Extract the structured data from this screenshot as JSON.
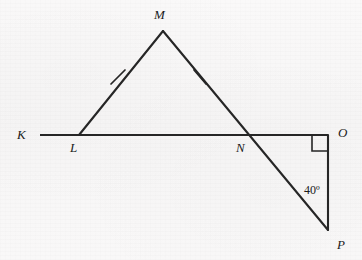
{
  "figure": {
    "kind": "geometry-diagram",
    "stroke_color": "#262626",
    "background_color": "#f8f7f7",
    "canvas": {
      "width": 362,
      "height": 260
    }
  },
  "points": {
    "K": {
      "label": "K",
      "x": 40,
      "y": 135,
      "label_x": 17,
      "label_y": 128
    },
    "L": {
      "label": "L",
      "x": 79,
      "y": 135,
      "label_x": 70,
      "label_y": 141
    },
    "M": {
      "label": "M",
      "x": 163,
      "y": 31,
      "label_x": 154,
      "label_y": 8
    },
    "N": {
      "label": "N",
      "x": 248,
      "y": 135,
      "label_x": 236,
      "label_y": 141
    },
    "O": {
      "label": "O",
      "x": 328,
      "y": 135,
      "label_x": 338,
      "label_y": 126
    },
    "P": {
      "label": "P",
      "x": 328,
      "y": 230,
      "label_x": 337,
      "label_y": 238
    }
  },
  "segments": [
    {
      "name": "segment-KO",
      "from": "K",
      "to": "O",
      "x1": 40,
      "y1": 135,
      "x2": 328,
      "y2": 135
    },
    {
      "name": "segment-LM",
      "from": "L",
      "to": "M",
      "x1": 79,
      "y1": 135,
      "x2": 163,
      "y2": 31
    },
    {
      "name": "segment-MP",
      "from": "M",
      "to": "P",
      "x1": 163,
      "y1": 31,
      "x2": 328,
      "y2": 230
    },
    {
      "name": "segment-OP",
      "from": "O",
      "to": "P",
      "x1": 328,
      "y1": 135,
      "x2": 328,
      "y2": 230
    }
  ],
  "tick_marks": [
    {
      "name": "congruence-tick-LM",
      "on_segment": "segment-LM",
      "x1": 111,
      "y1": 84,
      "x2": 125,
      "y2": 70
    },
    {
      "name": "congruence-tick-MN",
      "on_segment": "segment-MP",
      "x1": 194,
      "y1": 70,
      "x2": 206,
      "y2": 84
    }
  ],
  "right_angle": {
    "name": "right-angle-marker-O",
    "at_point": "O",
    "size": 16,
    "x": 312,
    "y": 135,
    "path": "M 312 135 L 312 151 L 328 151"
  },
  "angles": [
    {
      "name": "angle-label-P",
      "value": "40",
      "unit": "º",
      "text": "40º",
      "at_point": "P",
      "label_x": 304,
      "label_y": 184
    }
  ],
  "labels": {
    "K": "K",
    "L": "L",
    "M": "M",
    "N": "N",
    "O": "O",
    "P": "P",
    "angle_P": "40º"
  }
}
